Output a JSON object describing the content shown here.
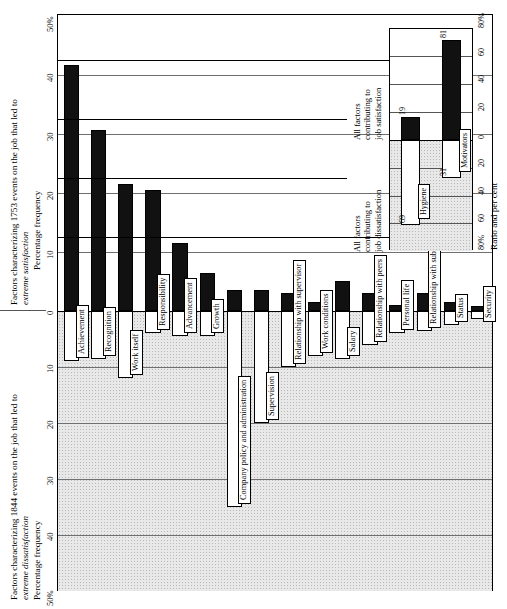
{
  "chart_data": {
    "type": "bar",
    "orientation": "vertical-bars-rotated-90",
    "upper_axis": {
      "caption_line1": "Factors characterizing 1753 events on the job that led to",
      "caption_line2": "extreme satisfaction",
      "ylabel": "Percentage frequency",
      "ticks": [
        "0",
        "10",
        "20",
        "30",
        "40",
        "50%"
      ],
      "ylim": [
        0,
        50
      ]
    },
    "lower_axis": {
      "caption_line1": "Factors characterizing 1844 events on the job that led to",
      "caption_line2": "extreme dissatisfaction",
      "ylabel": "Percentage frequency",
      "ticks": [
        "0",
        "10",
        "20",
        "30",
        "40",
        "50%"
      ],
      "ylim": [
        0,
        50
      ]
    },
    "categories": [
      "Achievement",
      "Recognition",
      "Work itself",
      "Responsibility",
      "Advancement",
      "Growth",
      "Company policy and administration",
      "Supervision",
      "Relationship with supervisor",
      "Work conditions",
      "Salary",
      "Relationship with peers",
      "Personal life",
      "Relationship with subordinates",
      "Status",
      "Security"
    ],
    "series": [
      {
        "name": "extreme satisfaction",
        "color": "#111111",
        "values": [
          41.5,
          30.5,
          21.5,
          20.5,
          11.5,
          6.5,
          3.5,
          3.5,
          3.0,
          1.5,
          5.0,
          3.0,
          1.0,
          3.0,
          1.5,
          0.8
        ]
      },
      {
        "name": "extreme dissatisfaction",
        "color": "#ffffff",
        "values": [
          9.0,
          8.5,
          12.0,
          4.0,
          4.5,
          4.5,
          35.0,
          20.0,
          10.0,
          8.0,
          8.5,
          6.0,
          4.0,
          3.5,
          2.5,
          1.5
        ]
      }
    ],
    "grid": true
  },
  "inset": {
    "caption_satisfaction": "All factors\ncontributing to\njob satisfaction",
    "caption_satisfaction_lines": [
      "All factors",
      "contributing to",
      "job satisfaction"
    ],
    "caption_dissatisfaction_lines": [
      "All factors",
      "contributing to",
      "job dissatisfaction"
    ],
    "axis_title": "Ratio and per cent",
    "ticks_top": [
      "0",
      "20",
      "40",
      "60",
      "80%"
    ],
    "ticks_bottom": [
      "20",
      "40",
      "60",
      "80%"
    ],
    "bars": [
      {
        "label": "Hygiene",
        "satisfaction": 19,
        "dissatisfaction": 69
      },
      {
        "label": "Motivators",
        "satisfaction": 81,
        "dissatisfaction": 31
      }
    ]
  }
}
